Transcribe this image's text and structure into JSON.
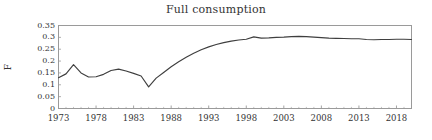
{
  "chart_data": {
    "type": "line",
    "title": "Full consumption",
    "xlabel": "",
    "ylabel": "F",
    "xlim": [
      1973,
      2020
    ],
    "ylim": [
      0,
      0.35
    ],
    "grid": false,
    "legend": null,
    "x_ticks": [
      "1973",
      "1978",
      "1983",
      "1988",
      "1993",
      "1998",
      "2003",
      "2008",
      "2013",
      "2018"
    ],
    "x_tick_values": [
      1973,
      1978,
      1983,
      1988,
      1993,
      1998,
      2003,
      2008,
      2013,
      2018
    ],
    "y_ticks": [
      "0",
      "0.05",
      "0.1",
      "0.15",
      "0.2",
      "0.25",
      "0.3",
      "0.35"
    ],
    "y_tick_values": [
      0,
      0.05,
      0.1,
      0.15,
      0.2,
      0.25,
      0.3,
      0.35
    ],
    "line_color": "#3f3f3f",
    "series": [
      {
        "name": "F",
        "x": [
          1973,
          1974,
          1975,
          1976,
          1977,
          1978,
          1979,
          1980,
          1981,
          1982,
          1983,
          1984,
          1985,
          1986,
          1987,
          1988,
          1989,
          1990,
          1991,
          1992,
          1993,
          1994,
          1995,
          1996,
          1997,
          1998,
          1999,
          2000,
          2001,
          2002,
          2003,
          2004,
          2005,
          2006,
          2007,
          2008,
          2009,
          2010,
          2011,
          2012,
          2013,
          2014,
          2015,
          2016,
          2017,
          2018,
          2019,
          2020
        ],
        "values": [
          0.13,
          0.146,
          0.185,
          0.15,
          0.133,
          0.134,
          0.144,
          0.16,
          0.166,
          0.158,
          0.148,
          0.137,
          0.091,
          0.128,
          0.152,
          0.176,
          0.197,
          0.216,
          0.233,
          0.248,
          0.26,
          0.27,
          0.278,
          0.284,
          0.289,
          0.292,
          0.302,
          0.297,
          0.298,
          0.3,
          0.301,
          0.303,
          0.304,
          0.303,
          0.301,
          0.299,
          0.297,
          0.296,
          0.295,
          0.294,
          0.294,
          0.291,
          0.29,
          0.291,
          0.291,
          0.292,
          0.292,
          0.291
        ]
      }
    ]
  }
}
